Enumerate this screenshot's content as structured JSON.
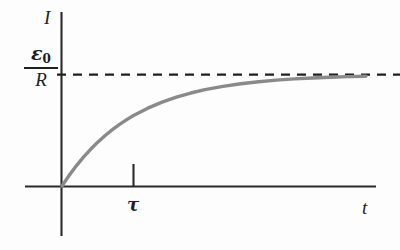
{
  "figure": {
    "background_color": "#fdfdfd",
    "axis_color": "#2a2a2a",
    "curve_color": "#8a8a8a",
    "dash_color": "#1f1f1f",
    "text_color": "#1f1f1f"
  },
  "labels": {
    "y_axis": "I",
    "x_axis": "t",
    "tau": "τ",
    "asymptote_numerator_symbol": "ε",
    "asymptote_numerator_subscript": "0",
    "asymptote_denominator": "R",
    "asymptote_value_text": "ε0/R"
  },
  "chart_data": {
    "type": "line",
    "title": "",
    "subtitle": "",
    "xlabel": "t",
    "ylabel": "I",
    "grid": false,
    "legend": "none",
    "xlim": [
      0,
      5.6
    ],
    "ylim": [
      0,
      1.12
    ],
    "xticks": [
      1
    ],
    "xticklabels": [
      "τ"
    ],
    "yticks": [
      1
    ],
    "yticklabels": [
      "ε0/R"
    ],
    "annotations": [
      {
        "name": "asymptote",
        "text": "ε0/R",
        "style": "dashed",
        "y": 1.0,
        "x_start": 0,
        "x_end": 5.2
      },
      {
        "name": "tau-tick",
        "text": "τ",
        "x": 1.0,
        "y": 0
      }
    ],
    "series": [
      {
        "name": "I(t) = (ε0/R)(1 - e^(-t/τ))",
        "x": [
          0,
          0.1,
          0.2,
          0.3,
          0.4,
          0.5,
          0.6,
          0.7,
          0.8,
          0.9,
          1.0,
          1.2,
          1.4,
          1.6,
          1.8,
          2.0,
          2.25,
          2.5,
          2.75,
          3.0,
          3.25,
          3.5,
          3.75,
          4.0,
          4.25
        ],
        "values": [
          0.0,
          0.0952,
          0.1813,
          0.2592,
          0.3297,
          0.3935,
          0.4512,
          0.5034,
          0.5507,
          0.5934,
          0.6321,
          0.6988,
          0.7534,
          0.7981,
          0.8347,
          0.8647,
          0.8946,
          0.9179,
          0.9361,
          0.9502,
          0.9612,
          0.9698,
          0.9765,
          0.9817,
          0.9857
        ]
      }
    ]
  }
}
